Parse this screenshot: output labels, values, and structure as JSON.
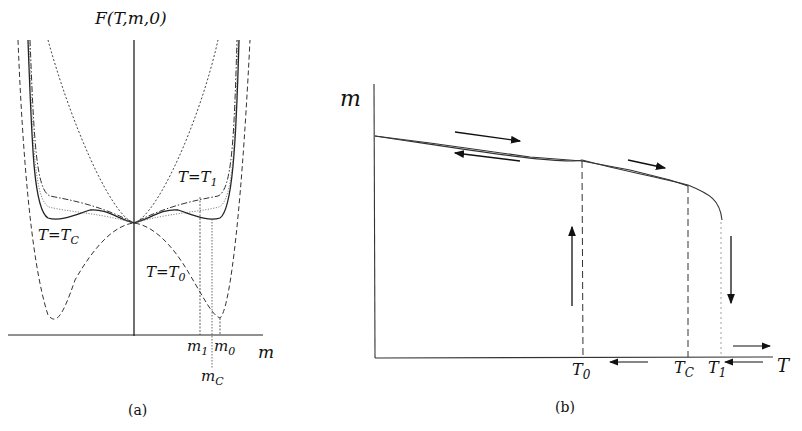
{
  "panel_a": {
    "y_axis_label": "F(T,m,0)",
    "x_axis_label": "m",
    "caption": "(a)",
    "curve_labels": [
      {
        "id": "T1",
        "text": "T=T",
        "sub": "1"
      },
      {
        "id": "TC",
        "text": "T=T",
        "sub": "C"
      },
      {
        "id": "T0",
        "text": "T=T",
        "sub": "0"
      }
    ],
    "tick_labels": [
      {
        "id": "m1",
        "text": "m",
        "sub": "1"
      },
      {
        "id": "m0",
        "text": "m",
        "sub": "0"
      },
      {
        "id": "mC",
        "text": "m",
        "sub": "C"
      }
    ]
  },
  "panel_b": {
    "y_axis_label": "m",
    "x_axis_label": "T",
    "caption": "(b)",
    "tick_labels": [
      {
        "id": "T0",
        "text": "T",
        "sub": "0"
      },
      {
        "id": "TC",
        "text": "T",
        "sub": "C"
      },
      {
        "id": "T1",
        "text": "T",
        "sub": "1"
      }
    ]
  },
  "colors": {
    "line": "#222222",
    "background": "#ffffff"
  }
}
